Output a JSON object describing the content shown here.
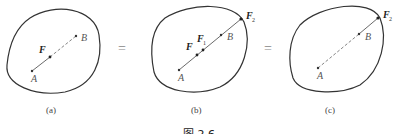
{
  "figure": {
    "caption": "图 2.6",
    "panels": [
      {
        "id": "a",
        "label": "(a)",
        "point_a": "A",
        "point_b": "B",
        "forces": [
          "F"
        ]
      },
      {
        "id": "b",
        "label": "(b)",
        "point_a": "A",
        "point_b": "B",
        "forces": [
          "F",
          "F",
          "F"
        ],
        "force_subscripts": [
          "",
          "1",
          "2"
        ]
      },
      {
        "id": "c",
        "label": "(c)",
        "point_a": "A",
        "point_b": "B",
        "forces": [
          "F"
        ],
        "force_subscripts": [
          "2"
        ]
      }
    ],
    "separators": [
      "=",
      "="
    ]
  }
}
